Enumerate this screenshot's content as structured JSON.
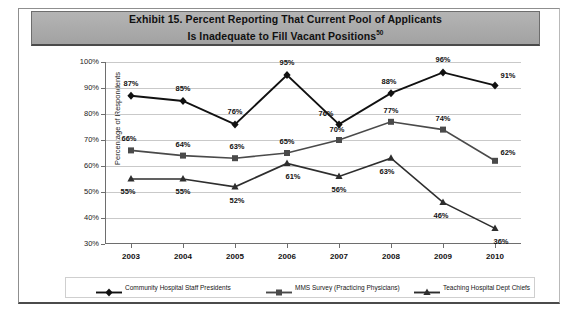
{
  "exhibit": {
    "title_line1": "Exhibit 15. Percent Reporting That Current Pool of Applicants",
    "title_line2": "Is Inadequate to Fill Vacant Positions",
    "title_superscript": "50"
  },
  "chart_data": {
    "type": "line",
    "title": "Exhibit 15. Percent Reporting That Current Pool of Applicants Is Inadequate to Fill Vacant Positions",
    "xlabel": "",
    "ylabel": "Percentage of Respondents",
    "categories": [
      "2003",
      "2004",
      "2005",
      "2006",
      "2007",
      "2008",
      "2009",
      "2010"
    ],
    "ylim": [
      30,
      100
    ],
    "yticks": [
      "30%",
      "40%",
      "50%",
      "60%",
      "70%",
      "80%",
      "90%",
      "100%"
    ],
    "ytick_values": [
      30,
      40,
      50,
      60,
      70,
      80,
      90,
      100
    ],
    "grid": true,
    "legend_position": "bottom",
    "series": [
      {
        "name": "Community Hospital Staff Presidents",
        "marker": "diamond",
        "color": "#111111",
        "values": [
          87,
          85,
          76,
          95,
          76,
          88,
          96,
          91
        ],
        "labels": [
          "87%",
          "85%",
          "76%",
          "95%",
          "76%",
          "88%",
          "96%",
          "91%"
        ]
      },
      {
        "name": "MMS Survey (Practicing Physicians)",
        "marker": "square",
        "color": "#4a4a4a",
        "values": [
          66,
          64,
          63,
          65,
          70,
          77,
          74,
          62
        ],
        "labels": [
          "66%",
          "64%",
          "63%",
          "65%",
          "70%",
          "77%",
          "74%",
          "62%"
        ]
      },
      {
        "name": "Teaching Hospital Dept Chiefs",
        "marker": "triangle",
        "color": "#2e2e2e",
        "values": [
          55,
          55,
          52,
          61,
          56,
          63,
          46,
          36
        ],
        "labels": [
          "55%",
          "55%",
          "52%",
          "61%",
          "56%",
          "63%",
          "46%",
          "36%"
        ]
      }
    ]
  }
}
